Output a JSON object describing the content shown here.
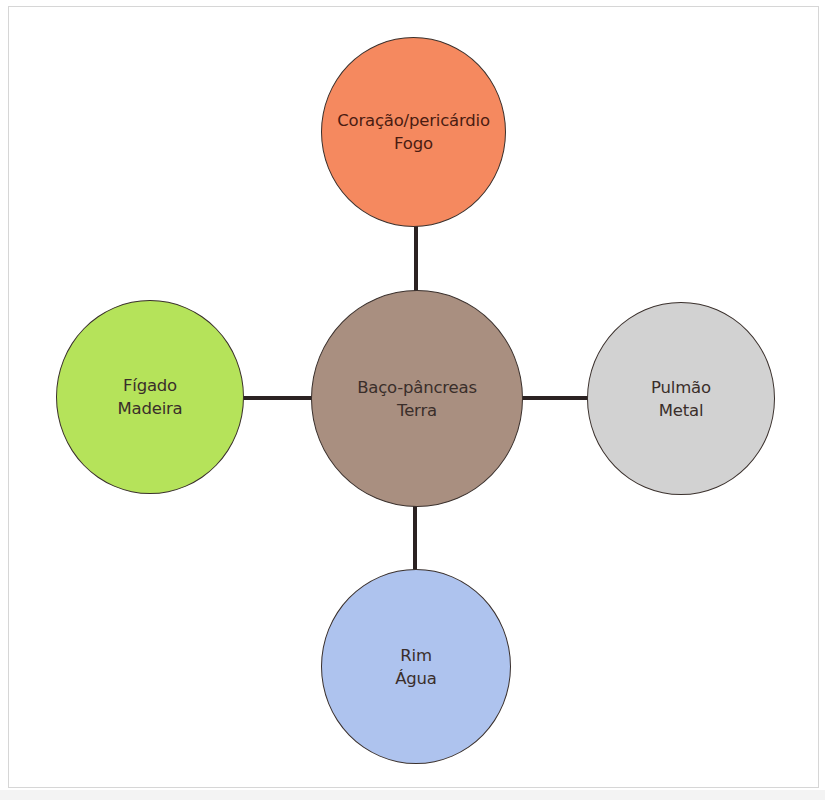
{
  "diagram": {
    "type": "five-elements-organ-map",
    "center": {
      "organ": "Baço-pâncreas",
      "element": "Terra",
      "color": "#a98f80"
    },
    "nodes": [
      {
        "position": "top",
        "organ": "Coração/pericárdio",
        "element": "Fogo",
        "color": "#f5895f"
      },
      {
        "position": "left",
        "organ": "Fígado",
        "element": "Madeira",
        "color": "#b5e35a"
      },
      {
        "position": "right",
        "organ": "Pulmão",
        "element": "Metal",
        "color": "#d2d2d2"
      },
      {
        "position": "bottom",
        "organ": "Rim",
        "element": "Água",
        "color": "#aec3ee"
      }
    ],
    "connections": [
      {
        "from": "Baço-pâncreas",
        "to": "Coração/pericárdio"
      },
      {
        "from": "Baço-pâncreas",
        "to": "Fígado"
      },
      {
        "from": "Baço-pâncreas",
        "to": "Pulmão"
      },
      {
        "from": "Baço-pâncreas",
        "to": "Rim"
      }
    ],
    "line_color": "#2b2222",
    "frame_color": "#d6d6d6"
  }
}
